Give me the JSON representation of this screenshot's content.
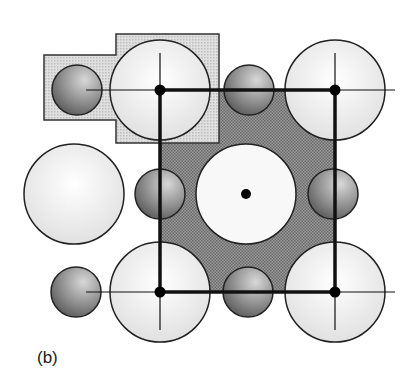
{
  "figure": {
    "label": "(b)",
    "colors": {
      "background": "#ffffff",
      "unit_cell_fill": "#8a8a8a",
      "inset_fill": "#d4d4d4",
      "large_sphere_fill": "#ececec",
      "small_sphere_fill": "#8c8c8c",
      "line": "#111111"
    },
    "unit_cell": {
      "x1": 160,
      "y1": 90,
      "x2": 335,
      "y2": 292
    },
    "lattice_points": [
      {
        "x": 160,
        "y": 90
      },
      {
        "x": 335,
        "y": 90
      },
      {
        "x": 160,
        "y": 292
      },
      {
        "x": 335,
        "y": 292
      },
      {
        "x": 246,
        "y": 194
      }
    ],
    "large_spheres": [
      {
        "cx": 160,
        "cy": 90,
        "r": 50
      },
      {
        "cx": 335,
        "cy": 90,
        "r": 50
      },
      {
        "cx": 74,
        "cy": 194,
        "r": 50
      },
      {
        "cx": 246,
        "cy": 194,
        "r": 50
      },
      {
        "cx": 160,
        "cy": 292,
        "r": 50
      },
      {
        "cx": 335,
        "cy": 292,
        "r": 50
      }
    ],
    "small_spheres": [
      {
        "cx": 77,
        "cy": 90,
        "r": 25
      },
      {
        "cx": 249,
        "cy": 90,
        "r": 25
      },
      {
        "cx": 160,
        "cy": 194,
        "r": 25
      },
      {
        "cx": 333,
        "cy": 194,
        "r": 25
      },
      {
        "cx": 76,
        "cy": 292,
        "r": 25
      },
      {
        "cx": 248,
        "cy": 292,
        "r": 25
      }
    ]
  }
}
